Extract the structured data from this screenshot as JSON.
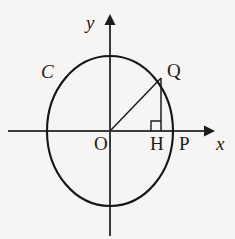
{
  "figure": {
    "type": "geometry-diagram",
    "background_color": "#f6f5f3",
    "stroke_color": "#1c1c1c",
    "axes": {
      "x_axis_label": "x",
      "y_axis_label": "y",
      "origin_label": "O",
      "x_axis": {
        "y": 131,
        "x_start": 8,
        "x_end": 212,
        "arrow": "right"
      },
      "y_axis": {
        "x": 110,
        "y_start": 236,
        "y_end": 17,
        "arrow": "up"
      }
    },
    "circle": {
      "label": "C",
      "center_x": 110,
      "center_y": 131,
      "radius_x": 63,
      "radius_y": 75
    },
    "points": [
      {
        "name": "O",
        "label": "O",
        "x": 110,
        "y": 131
      },
      {
        "name": "Q",
        "label": "Q",
        "x": 161,
        "y": 78
      },
      {
        "name": "H",
        "label": "H",
        "x": 161,
        "y": 131
      },
      {
        "name": "P",
        "label": "P",
        "x": 173,
        "y": 131
      }
    ],
    "segments": [
      {
        "name": "OQ",
        "x1": 110,
        "y1": 131,
        "x2": 161,
        "y2": 78
      },
      {
        "name": "QH",
        "x1": 161,
        "y1": 78,
        "x2": 161,
        "y2": 131
      }
    ],
    "right_angle_marker": {
      "at_point": "H",
      "size": 10,
      "x": 151,
      "y": 121
    }
  }
}
